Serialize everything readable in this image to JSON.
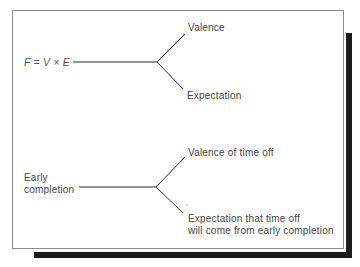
{
  "top_diagram": {
    "source": "F = V × E",
    "branch_upper": "Valence",
    "branch_lower": "Expectation"
  },
  "bottom_diagram": {
    "source_line1": "Early",
    "source_line2": "completion",
    "branch_upper": "Valence of time off",
    "branch_lower_line1": "Expectation that time off",
    "branch_lower_line2": "will come from early completion"
  },
  "colors": {
    "line": "#2a2a2a",
    "frame": "#8a8a8a",
    "shadow": "#1c1c1c",
    "text": "#444444"
  }
}
